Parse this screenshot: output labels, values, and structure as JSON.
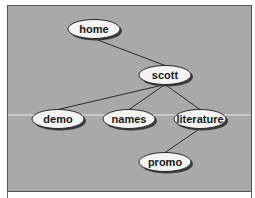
{
  "diagram": {
    "type": "tree",
    "colors": {
      "panel_fill": "#a9a9a9",
      "panel_border": "#555555",
      "node_fill": "#f4f4f4",
      "node_stroke": "#2a2a2a",
      "node_shadow": "#3a3a3a",
      "edge": "#2a2a2a",
      "scan_line": "#e8e8e8"
    },
    "nodes": [
      {
        "id": "home",
        "label": "home"
      },
      {
        "id": "scott",
        "label": "scott"
      },
      {
        "id": "demo",
        "label": "demo"
      },
      {
        "id": "names",
        "label": "names"
      },
      {
        "id": "literature",
        "label": "literature"
      },
      {
        "id": "promo",
        "label": "promo"
      }
    ],
    "edges": [
      {
        "from": "home",
        "to": "scott"
      },
      {
        "from": "scott",
        "to": "demo"
      },
      {
        "from": "scott",
        "to": "names"
      },
      {
        "from": "scott",
        "to": "literature"
      },
      {
        "from": "literature",
        "to": "promo"
      }
    ]
  }
}
